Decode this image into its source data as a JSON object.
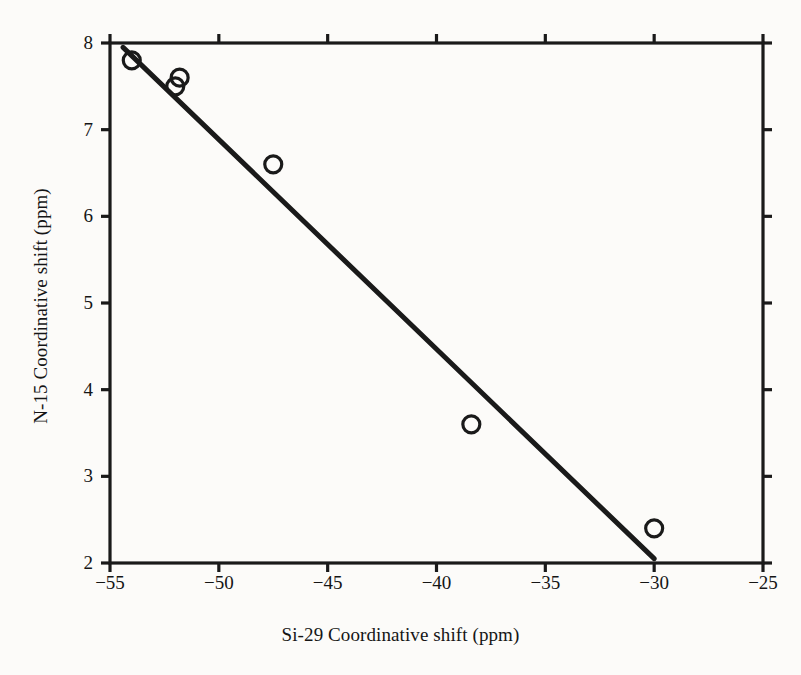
{
  "figure": {
    "background_color": "#fcfbf9",
    "ink_color": "#1a1a1a"
  },
  "chart_data": {
    "type": "scatter",
    "title": "",
    "xlabel": "Si-29 Coordinative shift (ppm)",
    "ylabel": "N-15 Coordinative shift (ppm)",
    "xlim": [
      -55,
      -25
    ],
    "ylim": [
      2,
      8
    ],
    "xticks": [
      -55,
      -50,
      -45,
      -40,
      -35,
      -30,
      -25
    ],
    "xtick_labels": [
      "−55",
      "−50",
      "−45",
      "−40",
      "−35",
      "−30",
      "−25"
    ],
    "yticks": [
      2,
      3,
      4,
      5,
      6,
      7,
      8
    ],
    "ytick_labels": [
      "2",
      "3",
      "4",
      "5",
      "6",
      "7",
      "8"
    ],
    "grid": false,
    "legend": null,
    "marker": "open-circle",
    "series": [
      {
        "name": "Coordinative shift correlation",
        "points": [
          {
            "x": -54.0,
            "y": 7.8
          },
          {
            "x": -52.0,
            "y": 7.5
          },
          {
            "x": -51.8,
            "y": 7.6
          },
          {
            "x": -47.5,
            "y": 6.6
          },
          {
            "x": -38.4,
            "y": 3.6
          },
          {
            "x": -30.0,
            "y": 2.4
          }
        ]
      }
    ],
    "fit_line": {
      "name": "linear trend",
      "x_start": -54.4,
      "y_start": 7.95,
      "x_end": -30.0,
      "y_end": 2.05,
      "slope": -0.2418,
      "intercept": -5.2
    },
    "axes_style": {
      "frame": "box",
      "tick_direction": "out",
      "top_ticks": true,
      "right_ticks": true
    }
  }
}
